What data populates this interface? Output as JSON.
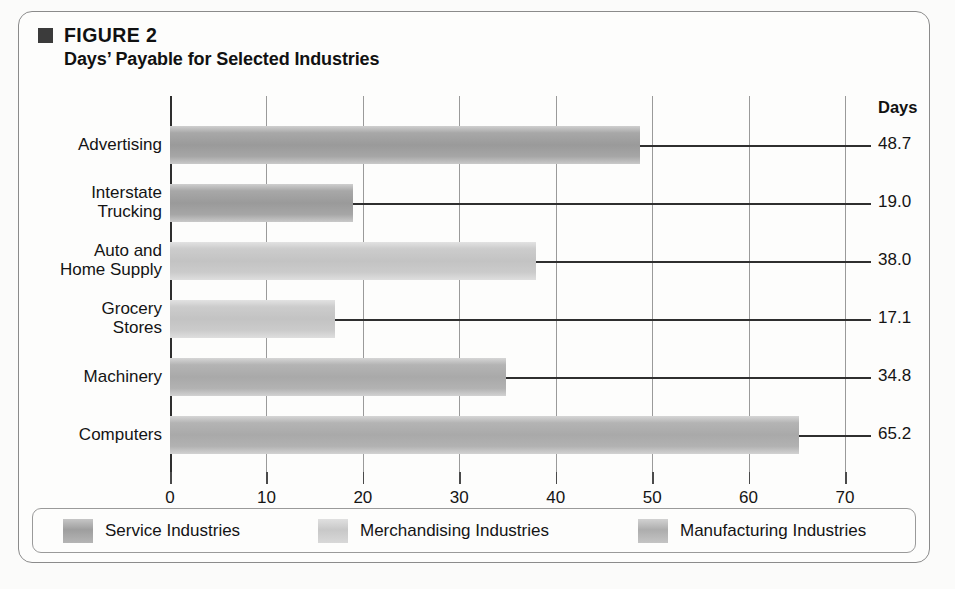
{
  "figure": {
    "eyebrow": "FIGURE 2",
    "title": "Days’ Payable for Selected Industries",
    "bullet_icon": "filled-square-icon"
  },
  "chart_data": {
    "type": "bar",
    "orientation": "horizontal",
    "title": "Days’ Payable for Selected Industries",
    "xlabel": "",
    "ylabel": "",
    "value_axis_header": "Days",
    "xlim": [
      0,
      70
    ],
    "grid": true,
    "xticks": [
      0,
      10,
      20,
      30,
      40,
      50,
      60,
      70
    ],
    "xtick_labels": [
      "0",
      "10",
      "20",
      "30",
      "40",
      "50",
      "60",
      "70"
    ],
    "categories": [
      "Advertising",
      "Interstate\nTrucking",
      "Auto and\nHome Supply",
      "Grocery\nStores",
      "Machinery",
      "Computers"
    ],
    "values": [
      48.7,
      19.0,
      38.0,
      17.1,
      34.8,
      65.2
    ],
    "value_labels": [
      "48.7",
      "19.0",
      "38.0",
      "17.1",
      "34.8",
      "65.2"
    ],
    "groups": [
      "service",
      "service",
      "merchandising",
      "merchandising",
      "manufacturing",
      "manufacturing"
    ],
    "series": [
      {
        "name": "Service Industries",
        "key": "service",
        "color": "#9e9e9e",
        "points": [
          {
            "category": "Advertising",
            "value": 48.7
          },
          {
            "category": "Interstate Trucking",
            "value": 19.0
          }
        ]
      },
      {
        "name": "Merchandising Industries",
        "key": "merchandising",
        "color": "#c8c8c8",
        "points": [
          {
            "category": "Auto and Home Supply",
            "value": 38.0
          },
          {
            "category": "Grocery Stores",
            "value": 17.1
          }
        ]
      },
      {
        "name": "Manufacturing Industries",
        "key": "manufacturing",
        "color": "#adadad",
        "points": [
          {
            "category": "Machinery",
            "value": 34.8
          },
          {
            "category": "Computers",
            "value": 65.2
          }
        ]
      }
    ],
    "legend": {
      "position": "bottom",
      "entries": [
        {
          "label": "Service Industries",
          "key": "service",
          "color": "#9e9e9e"
        },
        {
          "label": "Merchandising Industries",
          "key": "merchandising",
          "color": "#c8c8c8"
        },
        {
          "label": "Manufacturing Industries",
          "key": "manufacturing",
          "color": "#adadad"
        }
      ]
    }
  }
}
